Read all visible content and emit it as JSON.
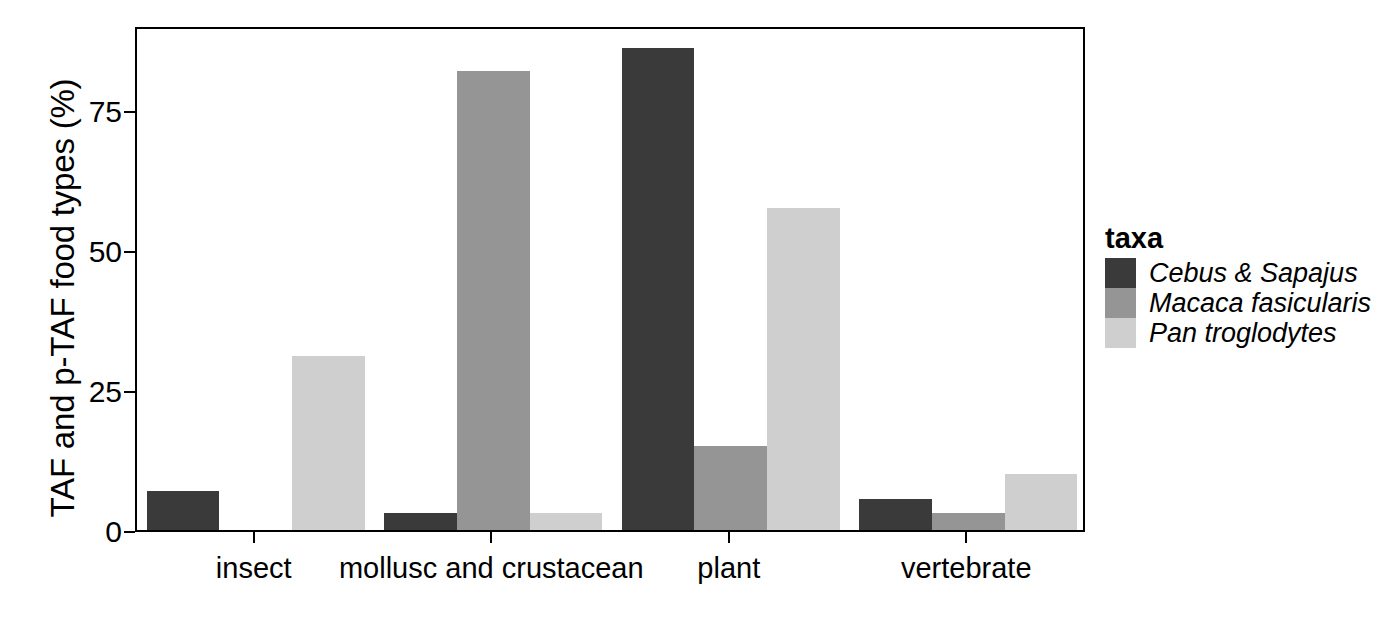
{
  "chart_data": {
    "type": "bar",
    "title": "",
    "subtitle": "",
    "xlabel": "",
    "ylabel": "TAF and p-TAF food types (%)",
    "categories": [
      "insect",
      "mollusc and crustacean",
      "plant",
      "vertebrate"
    ],
    "series": [
      {
        "name": "Cebus & Sapajus",
        "color": "#3a3a3a",
        "values": [
          7,
          3,
          86,
          5.5
        ]
      },
      {
        "name": "Macaca fasicularis",
        "color": "#959595",
        "values": [
          0,
          82,
          15,
          3
        ]
      },
      {
        "name": "Pan troglodytes",
        "color": "#cfcfcf",
        "values": [
          31,
          3,
          57.5,
          10
        ]
      }
    ],
    "ylim": [
      0,
      90
    ],
    "yticks": [
      0,
      25,
      50,
      75
    ],
    "ytick_labels": [
      "0",
      "25",
      "50",
      "75"
    ],
    "grid": false,
    "legend": {
      "title": "taxa",
      "position": "right",
      "entries": [
        "Cebus & Sapajus",
        "Macaca fasicularis",
        "Pan troglodytes"
      ]
    },
    "panel_border_color": "#000000",
    "background_color": "#ffffff"
  }
}
